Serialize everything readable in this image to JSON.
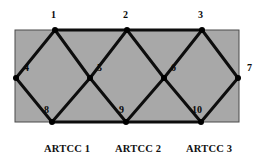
{
  "figure": {
    "title": "",
    "background_color": "#ffffff",
    "region_fill_color": "#a8a8a8",
    "region_border_color": "#4a4a4a",
    "edge_color": "#0d0d0d",
    "node_color": "#000000"
  },
  "region": {
    "x": 15,
    "y": 30,
    "width": 224,
    "height": 92
  },
  "nodes": [
    {
      "id": "1",
      "label": "1",
      "x": 55,
      "y": 30,
      "label_x": 51,
      "label_y": 10
    },
    {
      "id": "2",
      "label": "2",
      "x": 127,
      "y": 30,
      "label_x": 123,
      "label_y": 10
    },
    {
      "id": "3",
      "label": "3",
      "x": 202,
      "y": 30,
      "label_x": 198,
      "label_y": 10
    },
    {
      "id": "4",
      "label": "4",
      "x": 16,
      "y": 78,
      "label_x": 24,
      "label_y": 63
    },
    {
      "id": "5",
      "label": "5",
      "x": 90,
      "y": 78,
      "label_x": 97,
      "label_y": 63
    },
    {
      "id": "6",
      "label": "6",
      "x": 164,
      "y": 78,
      "label_x": 171,
      "label_y": 63
    },
    {
      "id": "7",
      "label": "7",
      "x": 238,
      "y": 78,
      "label_x": 247,
      "label_y": 63
    },
    {
      "id": "8",
      "label": "8",
      "x": 52,
      "y": 122,
      "label_x": 44,
      "label_y": 105
    },
    {
      "id": "9",
      "label": "9",
      "x": 126,
      "y": 122,
      "label_x": 119,
      "label_y": 105
    },
    {
      "id": "10",
      "label": "10",
      "x": 201,
      "y": 122,
      "label_x": 192,
      "label_y": 105
    }
  ],
  "edges": [
    {
      "from": "4",
      "to": "1"
    },
    {
      "from": "1",
      "to": "5"
    },
    {
      "from": "5",
      "to": "2"
    },
    {
      "from": "2",
      "to": "6"
    },
    {
      "from": "6",
      "to": "3"
    },
    {
      "from": "3",
      "to": "7"
    },
    {
      "from": "4",
      "to": "8"
    },
    {
      "from": "8",
      "to": "5"
    },
    {
      "from": "5",
      "to": "9"
    },
    {
      "from": "9",
      "to": "6"
    },
    {
      "from": "6",
      "to": "10"
    },
    {
      "from": "10",
      "to": "7"
    },
    {
      "from": "1",
      "to": "2"
    },
    {
      "from": "2",
      "to": "3"
    },
    {
      "from": "8",
      "to": "9"
    },
    {
      "from": "9",
      "to": "10"
    }
  ],
  "sector_labels": [
    {
      "text": "ARTCC 1",
      "x": 44,
      "y": 143
    },
    {
      "text": "ARTCC 2",
      "x": 115,
      "y": 143
    },
    {
      "text": "ARTCC 3",
      "x": 186,
      "y": 143
    }
  ]
}
